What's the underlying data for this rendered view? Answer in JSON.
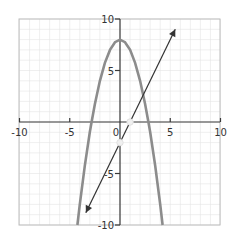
{
  "chart_data": {
    "type": "line",
    "title": "",
    "xlabel": "",
    "ylabel": "",
    "xlim": [
      -10,
      10
    ],
    "ylim": [
      -10,
      10
    ],
    "grid": true,
    "minor_grid_step": 1,
    "x_ticks": [
      -10,
      -5,
      0,
      5,
      10
    ],
    "x_tick_labels": [
      "-10",
      "-5",
      "0",
      "5",
      "10"
    ],
    "y_ticks": [
      -10,
      -5,
      5,
      10
    ],
    "y_tick_labels": [
      "-10",
      "-5",
      "5",
      "10"
    ],
    "series": [
      {
        "name": "parabola",
        "equation": "y = 8 - x^2",
        "color": "#8c8c8c",
        "x": [
          -4.24,
          -4,
          -3.5,
          -3,
          -2.83,
          -2.5,
          -2,
          -1.5,
          -1,
          -0.5,
          0,
          0.5,
          1,
          1.5,
          2,
          2.5,
          2.83,
          3,
          3.5,
          4,
          4.24
        ],
        "y": [
          -10,
          -8,
          -4.25,
          -1,
          0,
          1.75,
          4,
          5.75,
          7,
          7.75,
          8,
          7.75,
          7,
          5.75,
          4,
          1.75,
          0,
          -1,
          -4.25,
          -8,
          -10
        ]
      },
      {
        "name": "line",
        "equation": "y = 2x - 2",
        "color": "#333333",
        "x": [
          -3.4,
          5.5
        ],
        "y": [
          -8.8,
          9
        ],
        "arrows": "both"
      }
    ],
    "annotations": [
      {
        "type": "point",
        "x": 1,
        "y": 0,
        "style": "open-white"
      },
      {
        "type": "point",
        "x": 0,
        "y": -2,
        "style": "open-white"
      }
    ]
  }
}
